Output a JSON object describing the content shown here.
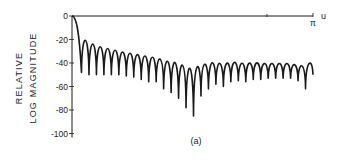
{
  "chart_data": {
    "type": "line",
    "title": "",
    "caption": "(a)",
    "xlabel": "u",
    "ylabel_lines": [
      "RELATIVE",
      "LOG MAGNITUDE"
    ],
    "x_end_label": "π",
    "xlim": [
      0,
      3.1416
    ],
    "ylim": [
      -100,
      0
    ],
    "y_ticks": [
      0,
      -20,
      -40,
      -60,
      -80,
      -100
    ],
    "y_tick_labels": [
      "0",
      "-20",
      "-40",
      "-60",
      "-80",
      "-100"
    ],
    "grid": false,
    "legend": null,
    "sidelobe_peaks_db": [
      -12,
      -16,
      -19,
      -21,
      -23,
      -25,
      -26,
      -27,
      -28,
      -29,
      -30,
      -31,
      -31,
      -32,
      -33,
      -33,
      -34,
      -34,
      -35,
      -35,
      -35,
      -36,
      -36,
      -36,
      -37,
      -37,
      -37,
      -37,
      -38,
      -38,
      -36
    ],
    "null_depths_db": [
      -48,
      -50,
      -50,
      -50,
      -50,
      -50,
      -51,
      -52,
      -54,
      -56,
      -56,
      -62,
      -65,
      -70,
      -78,
      -85,
      -68,
      -62,
      -58,
      -60,
      -56,
      -55,
      -56,
      -54,
      -54,
      -53,
      -53,
      -53,
      -53,
      -55,
      -62
    ],
    "colors": {
      "line": "#1a1a1a",
      "background": "#ffffff"
    }
  }
}
